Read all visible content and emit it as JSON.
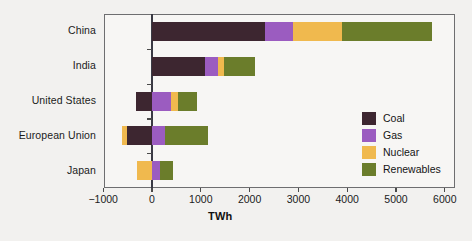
{
  "chart_data": {
    "type": "bar",
    "orientation": "horizontal",
    "stacked": true,
    "title": "",
    "xlabel": "TWh",
    "ylabel": "",
    "xlim": [
      -1000,
      6000
    ],
    "xticks": [
      -1000,
      0,
      1000,
      2000,
      3000,
      4000,
      5000,
      6000
    ],
    "xtick_labels": [
      "−1000",
      "0",
      "1000",
      "2000",
      "3000",
      "4000",
      "5000",
      "6000"
    ],
    "grid": false,
    "legend_position": "inside-right",
    "categories": [
      "China",
      "India",
      "United States",
      "European Union",
      "Japan"
    ],
    "series": [
      {
        "name": "Coal",
        "color": "#3d2630",
        "values": [
          2310,
          1090,
          -330,
          -510,
          0
        ]
      },
      {
        "name": "Gas",
        "color": "#9b5cc0",
        "values": [
          580,
          265,
          390,
          265,
          165
        ]
      },
      {
        "name": "Nuclear",
        "color": "#f0b94e",
        "values": [
          1010,
          125,
          145,
          -105,
          -310
        ]
      },
      {
        "name": "Renewables",
        "color": "#6b7d2b",
        "values": [
          1830,
          635,
          385,
          880,
          270
        ]
      }
    ]
  },
  "axis": {
    "x_title": "TWh",
    "tick_0": "0",
    "tick_neg1000": "−1000",
    "tick_1000": "1000",
    "tick_2000": "2000",
    "tick_3000": "3000",
    "tick_4000": "4000",
    "tick_5000": "5000",
    "tick_6000": "6000"
  },
  "categories": {
    "china": "China",
    "india": "India",
    "united_states": "United States",
    "european_union": "European Union",
    "japan": "Japan"
  },
  "legend": {
    "coal": "Coal",
    "gas": "Gas",
    "nuclear": "Nuclear",
    "renewables": "Renewables"
  },
  "colors": {
    "coal": "#3d2630",
    "gas": "#9b5cc0",
    "nuclear": "#f0b94e",
    "renewables": "#6b7d2b",
    "frame": "#6e6e70",
    "zero_axis": "#3a3a44",
    "page_background": "#f2f1ef",
    "plot_background": "#f7f6f4"
  }
}
